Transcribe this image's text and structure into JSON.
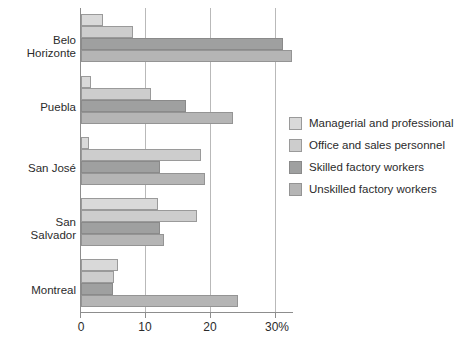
{
  "chart_data": {
    "type": "bar",
    "orientation": "horizontal",
    "title": "",
    "subtitle": "",
    "xlabel": "",
    "ylabel": "",
    "xlim": [
      0,
      30
    ],
    "xticks": [
      0,
      10,
      20,
      30
    ],
    "xtick_labels": [
      "0",
      "10",
      "20",
      "30%"
    ],
    "grid": true,
    "grid_axis": "x",
    "legend_position": "right",
    "categories": [
      "Belo\nHorizonte",
      "Puebla",
      "San José",
      "San\nSalvador",
      "Montreal"
    ],
    "category_labels_flat": [
      "Belo Horizonte",
      "Puebla",
      "San José",
      "San Salvador",
      "Montreal"
    ],
    "series": [
      {
        "name": "Managerial and professional",
        "color": "#d9d9d9",
        "values": [
          3.4,
          1.5,
          1.2,
          11.8,
          5.7
        ]
      },
      {
        "name": "Office and sales personnel",
        "color": "#cdcdcd",
        "values": [
          8.0,
          10.7,
          18.5,
          17.8,
          5.1
        ]
      },
      {
        "name": "Skilled factory workers",
        "color": "#9fa0a0",
        "values": [
          31.0,
          16.2,
          12.2,
          12.2,
          4.9
        ]
      },
      {
        "name": "Unskilled factory workers",
        "color": "#b5b5b5",
        "values": [
          32.5,
          23.4,
          19.0,
          12.8,
          24.2
        ]
      }
    ]
  },
  "legend": {
    "items": [
      {
        "label": "Managerial and professional"
      },
      {
        "label": "Office and sales personnel"
      },
      {
        "label": "Skilled factory workers"
      },
      {
        "label": "Unskilled factory workers"
      }
    ]
  },
  "axis": {
    "x_tick_labels": [
      "0",
      "10",
      "20",
      "30%"
    ]
  }
}
